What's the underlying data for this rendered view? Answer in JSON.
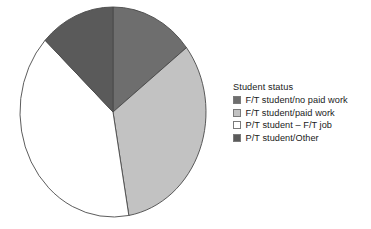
{
  "chart_data": {
    "type": "pie",
    "title": "",
    "legend_title": "Student status",
    "legend_position": "right",
    "categories": [
      "F/T student/no paid work",
      "F/T student/paid work",
      "P/T student – F/T job",
      "P/T student/Other"
    ],
    "values": [
      14.5,
      32.8,
      39.7,
      13.0
    ],
    "units": "percent",
    "start_angle": 0,
    "direction": "clockwise",
    "colors": [
      "#6e6e6e",
      "#c2c2c2",
      "#ffffff",
      "#5a5a5a"
    ],
    "slice_edge_color": "#4a4a4a",
    "xlabel": "",
    "ylabel": "",
    "grid": false
  },
  "legend": {
    "title": "Student status",
    "items": [
      {
        "label": "F/T student/no paid work",
        "color": "#6e6e6e"
      },
      {
        "label": "F/T student/paid work",
        "color": "#c2c2c2"
      },
      {
        "label": "P/T student – F/T job",
        "color": "#ffffff"
      },
      {
        "label": "P/T student/Other",
        "color": "#5a5a5a"
      }
    ]
  },
  "pie": {
    "center_x": 113,
    "center_y": 112,
    "radius_x": 93,
    "radius_y": 105,
    "slices": [
      {
        "name": "F/T student/no paid work",
        "value": 14.5,
        "start_deg": 0,
        "end_deg": 52.2,
        "color": "#6e6e6e"
      },
      {
        "name": "F/T student/paid work",
        "value": 32.8,
        "start_deg": 52.2,
        "end_deg": 170.2,
        "color": "#c2c2c2"
      },
      {
        "name": "P/T student – F/T job",
        "value": 39.7,
        "start_deg": 170.2,
        "end_deg": 313.1,
        "color": "#ffffff"
      },
      {
        "name": "P/T student/Other",
        "value": 13.0,
        "start_deg": 313.1,
        "end_deg": 360,
        "color": "#5a5a5a"
      }
    ]
  }
}
